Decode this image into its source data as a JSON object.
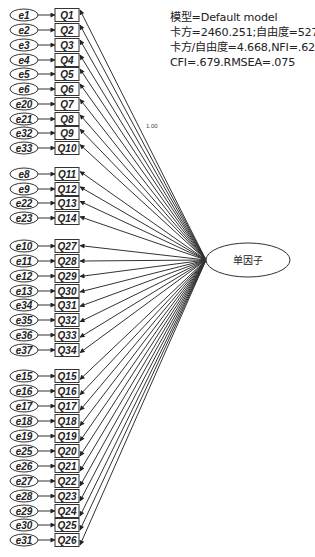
{
  "fit_stats": {
    "line1": "模型=Default model",
    "line2": "卡方=2460.251;自由度=527",
    "line3": "卡方/自由度=4.668,NFI=.627",
    "line4": "CFI=.679.RMSEA=.075"
  },
  "factor": {
    "label": "单因子",
    "cx": 248,
    "cy": 260,
    "rx": 42,
    "ry": 17
  },
  "fixed_loading_label": "1.00",
  "colors": {
    "stroke": "#333333",
    "fill": "#ffffff",
    "text": "#222222"
  },
  "indicators": [
    {
      "error": "e1",
      "item": "Q1",
      "y": 15
    },
    {
      "error": "e2",
      "item": "Q2",
      "y": 30
    },
    {
      "error": "e3",
      "item": "Q3",
      "y": 45
    },
    {
      "error": "e4",
      "item": "Q4",
      "y": 60
    },
    {
      "error": "e5",
      "item": "Q5",
      "y": 74
    },
    {
      "error": "e6",
      "item": "Q6",
      "y": 89
    },
    {
      "error": "e20",
      "item": "Q7",
      "y": 104
    },
    {
      "error": "e21",
      "item": "Q8",
      "y": 119
    },
    {
      "error": "e32",
      "item": "Q9",
      "y": 133
    },
    {
      "error": "e33",
      "item": "Q10",
      "y": 148
    },
    {
      "error": "e8",
      "item": "Q11",
      "y": 174
    },
    {
      "error": "e9",
      "item": "Q12",
      "y": 189
    },
    {
      "error": "e22",
      "item": "Q13",
      "y": 203
    },
    {
      "error": "e23",
      "item": "Q14",
      "y": 218
    },
    {
      "error": "e10",
      "item": "Q27",
      "y": 246
    },
    {
      "error": "e11",
      "item": "Q28",
      "y": 261
    },
    {
      "error": "e12",
      "item": "Q29",
      "y": 276
    },
    {
      "error": "e13",
      "item": "Q30",
      "y": 291
    },
    {
      "error": "e34",
      "item": "Q31",
      "y": 305
    },
    {
      "error": "e35",
      "item": "Q32",
      "y": 320
    },
    {
      "error": "e36",
      "item": "Q33",
      "y": 335
    },
    {
      "error": "e37",
      "item": "Q34",
      "y": 350
    },
    {
      "error": "e15",
      "item": "Q15",
      "y": 376
    },
    {
      "error": "e16",
      "item": "Q16",
      "y": 391
    },
    {
      "error": "e17",
      "item": "Q17",
      "y": 406
    },
    {
      "error": "e18",
      "item": "Q18",
      "y": 421
    },
    {
      "error": "e19",
      "item": "Q19",
      "y": 436
    },
    {
      "error": "e25",
      "item": "Q20",
      "y": 451
    },
    {
      "error": "e26",
      "item": "Q21",
      "y": 466
    },
    {
      "error": "e27",
      "item": "Q22",
      "y": 481
    },
    {
      "error": "e28",
      "item": "Q23",
      "y": 496
    },
    {
      "error": "e29",
      "item": "Q24",
      "y": 511
    },
    {
      "error": "e30",
      "item": "Q25",
      "y": 525
    },
    {
      "error": "e31",
      "item": "Q26",
      "y": 540
    }
  ]
}
